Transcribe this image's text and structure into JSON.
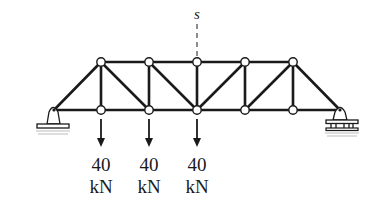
{
  "diagram": {
    "type": "truss",
    "section_label": "s",
    "loads": [
      {
        "value": "40",
        "unit": "kN",
        "node": "L1"
      },
      {
        "value": "40",
        "unit": "kN",
        "node": "L2"
      },
      {
        "value": "40",
        "unit": "kN",
        "node": "L3"
      }
    ],
    "supports": {
      "left": "pin",
      "right": "roller"
    },
    "colors": {
      "member": "#1a1a1a",
      "node_fill": "#ffffff",
      "background": "#ffffff",
      "ground_hatch": "#bdbdbd"
    }
  }
}
